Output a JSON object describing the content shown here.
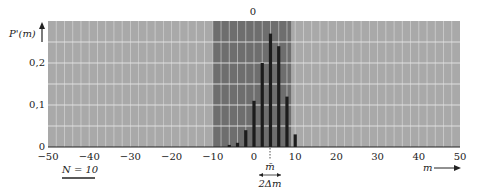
{
  "chart_data": {
    "type": "bar",
    "title": "",
    "top_annotation": "0",
    "xlabel": "m",
    "ylabel": "P'(m)",
    "xlim": [
      -50,
      50
    ],
    "ylim": [
      0,
      0.3
    ],
    "x_ticks": [
      -50,
      -40,
      -30,
      -20,
      -10,
      0,
      10,
      20,
      30,
      40,
      50
    ],
    "x_tick_labels": [
      "−50",
      "−40",
      "−30",
      "−20",
      "−10",
      "0",
      "10",
      "20",
      "30",
      "40",
      "50"
    ],
    "y_ticks": [
      0,
      0.1,
      0.2
    ],
    "y_tick_labels": [
      "0",
      "0,1",
      "0,2"
    ],
    "grid": true,
    "x": [
      -6,
      -4,
      -2,
      0,
      2,
      4,
      6,
      8,
      10
    ],
    "values": [
      0.005,
      0.01,
      0.04,
      0.11,
      0.2,
      0.27,
      0.24,
      0.12,
      0.03
    ],
    "highlight_band": [
      -10,
      9
    ],
    "annotations": {
      "n_label": "N = 10",
      "mean_label": "m̄",
      "mean_value": 4,
      "width_label": "2Δm",
      "width_range": [
        1,
        7
      ]
    },
    "legend": []
  },
  "colors": {
    "background": "#ffffff",
    "plot_bg": "#a9a9a9",
    "band_bg": "#6e6e6e",
    "grid": "#e6e6e6",
    "bar": "#1c1c1c",
    "text": "#222222"
  }
}
